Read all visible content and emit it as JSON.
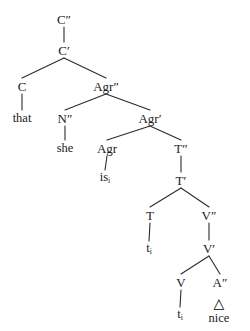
{
  "figure": {
    "kind": "syntax-tree",
    "notation": "x-bar",
    "width": 250,
    "height": 331,
    "background_color": "#ffffff",
    "line_color": "#2b2b2b",
    "text_color": "#1a1a1a",
    "sentence": "that she is nice"
  },
  "nodes": [
    {
      "id": "Cmax",
      "label": "C″",
      "x": 64,
      "y": 19,
      "type": "phrase"
    },
    {
      "id": "Cbar",
      "label": "C′",
      "x": 64,
      "y": 50,
      "type": "bar"
    },
    {
      "id": "C",
      "label": "C",
      "x": 22,
      "y": 86,
      "type": "head"
    },
    {
      "id": "that",
      "label": "that",
      "x": 22,
      "y": 118,
      "type": "terminal"
    },
    {
      "id": "Agrmax",
      "label": "Agr″",
      "x": 106,
      "y": 86,
      "type": "phrase"
    },
    {
      "id": "Nmax",
      "label": "N″",
      "x": 65,
      "y": 118,
      "type": "phrase"
    },
    {
      "id": "she",
      "label": "she",
      "x": 65,
      "y": 148,
      "type": "terminal"
    },
    {
      "id": "Agrbar",
      "label": "Agr′",
      "x": 150,
      "y": 118,
      "type": "bar"
    },
    {
      "id": "Agr",
      "label": "Agr",
      "x": 107,
      "y": 148,
      "type": "head"
    },
    {
      "id": "is",
      "label": "is",
      "x": 105,
      "y": 178,
      "type": "terminal",
      "subscript": "i"
    },
    {
      "id": "Tmax",
      "label": "T″",
      "x": 181,
      "y": 148,
      "type": "phrase"
    },
    {
      "id": "Tbar",
      "label": "T′",
      "x": 181,
      "y": 180,
      "type": "bar"
    },
    {
      "id": "T",
      "label": "T",
      "x": 150,
      "y": 215,
      "type": "head"
    },
    {
      "id": "tT",
      "label": "t",
      "x": 149,
      "y": 249,
      "type": "trace",
      "subscript": "i"
    },
    {
      "id": "Vmax",
      "label": "V″",
      "x": 209,
      "y": 215,
      "type": "phrase"
    },
    {
      "id": "Vbar",
      "label": "V′",
      "x": 209,
      "y": 248,
      "type": "bar"
    },
    {
      "id": "V",
      "label": "V",
      "x": 181,
      "y": 282,
      "type": "head"
    },
    {
      "id": "tV",
      "label": "t",
      "x": 180,
      "y": 315,
      "type": "trace",
      "subscript": "i"
    },
    {
      "id": "Amax",
      "label": "A″",
      "x": 220,
      "y": 282,
      "type": "phrase"
    },
    {
      "id": "nice",
      "label": "nice",
      "x": 219,
      "y": 311,
      "type": "triangle-terminal",
      "triangle": true
    }
  ],
  "edges": [
    {
      "from": "Cmax",
      "to": "Cbar",
      "style": "vertical"
    },
    {
      "from": "Cbar",
      "to": "C",
      "style": "branch"
    },
    {
      "from": "Cbar",
      "to": "Agrmax",
      "style": "branch"
    },
    {
      "from": "C",
      "to": "that",
      "style": "vertical"
    },
    {
      "from": "Agrmax",
      "to": "Nmax",
      "style": "branch"
    },
    {
      "from": "Agrmax",
      "to": "Agrbar",
      "style": "branch"
    },
    {
      "from": "Nmax",
      "to": "she",
      "style": "vertical"
    },
    {
      "from": "Agrbar",
      "to": "Agr",
      "style": "branch"
    },
    {
      "from": "Agrbar",
      "to": "Tmax",
      "style": "branch"
    },
    {
      "from": "Agr",
      "to": "is",
      "style": "vertical"
    },
    {
      "from": "Tmax",
      "to": "Tbar",
      "style": "vertical"
    },
    {
      "from": "Tbar",
      "to": "T",
      "style": "branch"
    },
    {
      "from": "Tbar",
      "to": "Vmax",
      "style": "branch"
    },
    {
      "from": "T",
      "to": "tT",
      "style": "vertical"
    },
    {
      "from": "Vmax",
      "to": "Vbar",
      "style": "vertical"
    },
    {
      "from": "Vbar",
      "to": "V",
      "style": "branch"
    },
    {
      "from": "Vbar",
      "to": "Amax",
      "style": "branch"
    },
    {
      "from": "V",
      "to": "tV",
      "style": "vertical"
    }
  ],
  "triangle": {
    "glyph": "△",
    "label": "nice",
    "size": 14
  }
}
